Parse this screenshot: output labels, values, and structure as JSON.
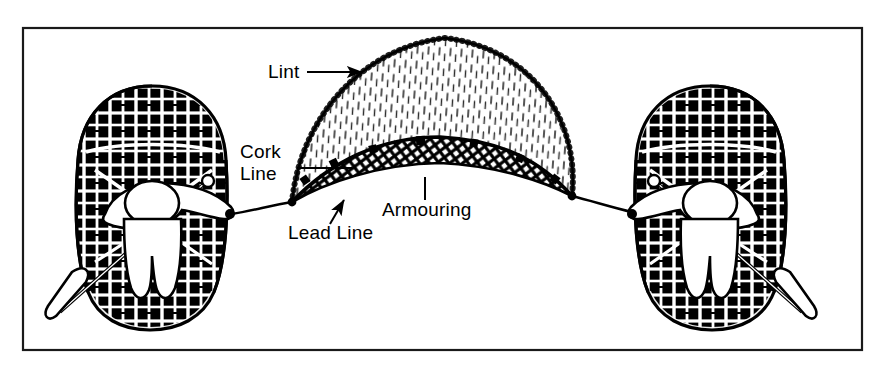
{
  "figure": {
    "background_color": "#ffffff",
    "ink_color": "#000000",
    "frame": {
      "name": "diagram-border",
      "x": 23,
      "y": 28,
      "width": 839,
      "height": 322,
      "stroke_width": 2,
      "color": "#1a1a1a"
    }
  },
  "labels": [
    {
      "id": "lint",
      "text": "Lint",
      "x": 268,
      "y": 78,
      "lines": [
        "Lint"
      ],
      "leader": {
        "type": "arrow",
        "from_x": 307,
        "from_y": 72,
        "to_x": 362,
        "to_y": 72
      }
    },
    {
      "id": "cork-line",
      "text": "Cork Line",
      "x": 240,
      "y": 158,
      "lines": [
        "Cork",
        "Line"
      ],
      "leader": {
        "type": "plain",
        "from_x": 297,
        "from_y": 168,
        "to_x": 352,
        "to_y": 168
      }
    },
    {
      "id": "lead-line",
      "text": "Lead Line",
      "x": 288,
      "y": 239,
      "lines": [
        "Lead Line"
      ],
      "leader": {
        "type": "arrow",
        "from_x": 330,
        "from_y": 224,
        "to_x": 344,
        "to_y": 200
      }
    },
    {
      "id": "armouring",
      "text": "Armouring",
      "x": 382,
      "y": 216,
      "lines": [
        "Armouring"
      ],
      "leader": {
        "type": "plain",
        "from_x": 425,
        "from_y": 200,
        "to_x": 425,
        "to_y": 177
      }
    }
  ],
  "net": {
    "name": "seine-net",
    "apex": {
      "x": 445,
      "y": 38
    },
    "left_foot": {
      "x": 292,
      "y": 202
    },
    "right_foot": {
      "x": 572,
      "y": 196
    },
    "parts": [
      {
        "name": "lint",
        "fill": "vertical-hatch",
        "description": "fine vertical tick hatching"
      },
      {
        "name": "armouring",
        "fill": "diamond-mesh",
        "description": "dense diagonal cross-hatch band"
      },
      {
        "name": "cork-line",
        "fill": "solid-line",
        "description": "upper edge of armouring with cork floats"
      },
      {
        "name": "lead-line",
        "fill": "solid-line",
        "description": "lower edge of the net"
      }
    ],
    "cork_count": 7
  },
  "boats": [
    {
      "id": "left-coracle",
      "name": "coracle-left",
      "center_x": 152,
      "center_y": 195,
      "paddle_side": "left",
      "rope_attach": {
        "x": 232,
        "y": 214
      }
    },
    {
      "id": "right-coracle",
      "name": "coracle-right",
      "center_x": 710,
      "center_y": 195,
      "paddle_side": "right",
      "rope_attach": {
        "x": 632,
        "y": 212
      }
    }
  ],
  "ropes": [
    {
      "id": "left-tow-rope",
      "from_x": 232,
      "from_y": 214,
      "to_x": 292,
      "to_y": 202
    },
    {
      "id": "right-tow-rope",
      "from_x": 572,
      "from_y": 196,
      "to_x": 632,
      "to_y": 212
    }
  ]
}
